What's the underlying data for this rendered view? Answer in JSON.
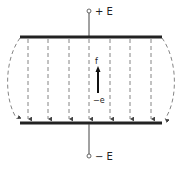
{
  "diagram": {
    "type": "parallel-plate-capacitor-field",
    "top_terminal_label": "+ E",
    "bottom_terminal_label": "− E",
    "charge_label": "−e",
    "force_label": "f",
    "colors": {
      "plate": "#222222",
      "field_line": "#666666",
      "background": "#ffffff"
    },
    "field_line_count": 7,
    "fringe_lines": 2
  }
}
